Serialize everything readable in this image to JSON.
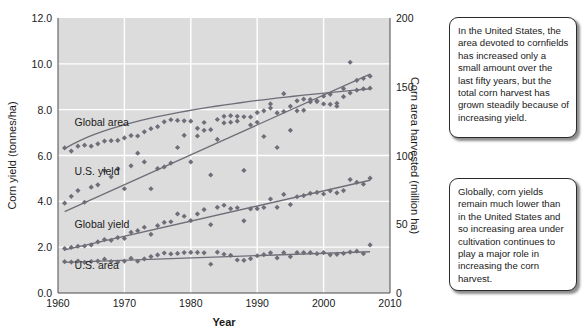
{
  "figure": {
    "background_color": "#ffffff",
    "plot_background_color": "#dcdcdc",
    "gridline_color": "#ffffff",
    "series_color": "#6e6e78",
    "text_color": "#1a1a1a"
  },
  "callouts": [
    {
      "id": "callout-united-states",
      "text": "In the United States, the area devoted to cornfields has increased only a small amount over the last fifty years, but the total corn harvest has grown steadily because of increasing yield."
    },
    {
      "id": "callout-global",
      "text": "Globally, corn yields remain much lower than in the United States and so increasing area under cultivation continues to play a major role in increasing the corn harvest."
    }
  ],
  "chart_data": {
    "type": "scatter",
    "title": "",
    "xlabel": "Year",
    "ylabel": "Corn yield (tonnes/ha)",
    "y2label": "Corn area harvested (million ha)",
    "xlim": [
      1960,
      2010
    ],
    "ylim": [
      0.0,
      12.0
    ],
    "y2lim": [
      0,
      200
    ],
    "xticks": [
      1960,
      1970,
      1980,
      1990,
      2000,
      2010
    ],
    "xticklabels": [
      "1960",
      "1970",
      "1980",
      "1990",
      "2000",
      "2010"
    ],
    "yticks": [
      0.0,
      2.0,
      4.0,
      6.0,
      8.0,
      10.0,
      12.0
    ],
    "yticklabels": [
      "0.0",
      "2.0",
      "4.0",
      "6.0",
      "8.0",
      "10.0",
      "12.0"
    ],
    "y2ticks": [
      0,
      50,
      100,
      150,
      200
    ],
    "y2ticklabels": [
      "0",
      "50",
      "100",
      "150",
      "200"
    ],
    "grid": true,
    "legend_position": "inline-annotations",
    "marker": "diamond",
    "annotations": [
      {
        "label": "Global area",
        "x": 1962.5,
        "y": 7.3
      },
      {
        "label": "U.S. yield",
        "x": 1962.5,
        "y": 5.15
      },
      {
        "label": "Global yield",
        "x": 1962.5,
        "y": 2.85
      },
      {
        "label": "U.S. area",
        "x": 1962.5,
        "y": 1.05
      }
    ],
    "series": [
      {
        "name": "Global area",
        "axis": "right",
        "units": "million ha",
        "x": [
          1961,
          1962,
          1963,
          1964,
          1965,
          1966,
          1967,
          1968,
          1969,
          1970,
          1971,
          1972,
          1973,
          1974,
          1975,
          1976,
          1977,
          1978,
          1979,
          1980,
          1981,
          1982,
          1983,
          1984,
          1985,
          1986,
          1987,
          1988,
          1989,
          1990,
          1991,
          1992,
          1993,
          1994,
          1995,
          1996,
          1997,
          1998,
          1999,
          2000,
          2001,
          2002,
          2003,
          2004,
          2005,
          2006,
          2007
        ],
        "y": [
          105.5,
          103.2,
          106.8,
          107.5,
          106.8,
          108.5,
          110.5,
          110.8,
          111.0,
          112.8,
          114.5,
          114.2,
          117.2,
          119.5,
          121.0,
          124.5,
          126.0,
          125.5,
          125.2,
          125.0,
          119.8,
          124.0,
          118.8,
          126.2,
          128.5,
          129.0,
          128.5,
          128.2,
          128.0,
          131.2,
          132.5,
          134.5,
          131.0,
          132.0,
          135.8,
          139.8,
          141.0,
          139.0,
          139.2,
          137.5,
          137.2,
          138.0,
          142.8,
          145.5,
          147.5,
          148.5,
          149.0
        ],
        "trend": {
          "type": "log-fit",
          "x": [
            1961,
            2007
          ],
          "y": [
            105.0,
            148.5
          ]
        }
      },
      {
        "name": "U.S. yield",
        "axis": "left",
        "units": "tonnes/ha",
        "x": [
          1961,
          1962,
          1963,
          1964,
          1965,
          1966,
          1967,
          1968,
          1969,
          1970,
          1971,
          1972,
          1973,
          1974,
          1975,
          1976,
          1977,
          1978,
          1979,
          1980,
          1981,
          1982,
          1983,
          1984,
          1985,
          1986,
          1987,
          1988,
          1989,
          1990,
          1991,
          1992,
          1993,
          1994,
          1995,
          1996,
          1997,
          1998,
          1999,
          2000,
          2001,
          2002,
          2003,
          2004,
          2005,
          2006,
          2007
        ],
        "y": [
          3.92,
          4.22,
          4.47,
          3.96,
          4.62,
          4.72,
          5.35,
          5.07,
          5.42,
          4.55,
          5.55,
          6.1,
          5.72,
          4.55,
          5.43,
          5.5,
          5.67,
          6.35,
          6.88,
          5.72,
          6.85,
          7.1,
          5.15,
          6.7,
          7.42,
          7.45,
          7.5,
          5.35,
          7.33,
          7.45,
          6.83,
          8.25,
          6.35,
          8.7,
          7.1,
          7.95,
          7.97,
          8.44,
          8.39,
          8.59,
          8.67,
          8.15,
          8.92,
          10.07,
          9.28,
          9.36,
          9.46
        ],
        "trend": {
          "type": "linear",
          "x": [
            1961,
            2007
          ],
          "y": [
            3.55,
            9.55
          ]
        }
      },
      {
        "name": "Global yield",
        "axis": "left",
        "units": "tonnes/ha",
        "x": [
          1961,
          1962,
          1963,
          1964,
          1965,
          1966,
          1967,
          1968,
          1969,
          1970,
          1971,
          1972,
          1973,
          1974,
          1975,
          1976,
          1977,
          1978,
          1979,
          1980,
          1981,
          1982,
          1983,
          1984,
          1985,
          1986,
          1987,
          1988,
          1989,
          1990,
          1991,
          1992,
          1993,
          1994,
          1995,
          1996,
          1997,
          1998,
          1999,
          2000,
          2001,
          2002,
          2003,
          2004,
          2005,
          2006,
          2007
        ],
        "y": [
          1.94,
          1.99,
          2.04,
          2.05,
          2.1,
          2.23,
          2.33,
          2.3,
          2.42,
          2.38,
          2.65,
          2.72,
          2.87,
          2.56,
          2.94,
          3.08,
          3.11,
          3.45,
          3.35,
          3.16,
          3.45,
          3.64,
          2.98,
          3.74,
          3.83,
          3.68,
          3.72,
          3.15,
          3.67,
          3.68,
          3.73,
          4.1,
          3.74,
          4.3,
          3.86,
          4.2,
          4.25,
          4.35,
          4.39,
          4.32,
          4.46,
          4.37,
          4.47,
          4.95,
          4.83,
          4.75,
          5.01
        ],
        "trend": {
          "type": "linear",
          "x": [
            1961,
            2007
          ],
          "y": [
            1.88,
            4.92
          ]
        }
      },
      {
        "name": "U.S. area",
        "axis": "right",
        "units": "million ha",
        "x": [
          1961,
          1962,
          1963,
          1964,
          1965,
          1966,
          1967,
          1968,
          1969,
          1970,
          1971,
          1972,
          1973,
          1974,
          1975,
          1976,
          1977,
          1978,
          1979,
          1980,
          1981,
          1982,
          1983,
          1984,
          1985,
          1986,
          1987,
          1988,
          1989,
          1990,
          1991,
          1992,
          1993,
          1994,
          1995,
          1996,
          1997,
          1998,
          1999,
          2000,
          2001,
          2002,
          2003,
          2004,
          2005,
          2006,
          2007
        ],
        "y": [
          22.8,
          22.5,
          23.2,
          22.3,
          22.9,
          23.2,
          24.6,
          22.9,
          22.5,
          23.2,
          25.2,
          23.1,
          24.8,
          26.5,
          27.7,
          29.1,
          28.4,
          28.8,
          29.4,
          29.5,
          29.5,
          29.2,
          20.9,
          29.7,
          28.2,
          27.4,
          24.0,
          23.8,
          25.0,
          27.1,
          27.9,
          29.2,
          25.5,
          29.3,
          26.4,
          29.4,
          29.4,
          29.4,
          28.6,
          29.3,
          27.8,
          28.1,
          28.8,
          29.8,
          30.4,
          28.6,
          35.0
        ],
        "trend": {
          "type": "linear",
          "x": [
            1961,
            2007
          ],
          "y": [
            22.3,
            30.0
          ]
        }
      }
    ]
  }
}
